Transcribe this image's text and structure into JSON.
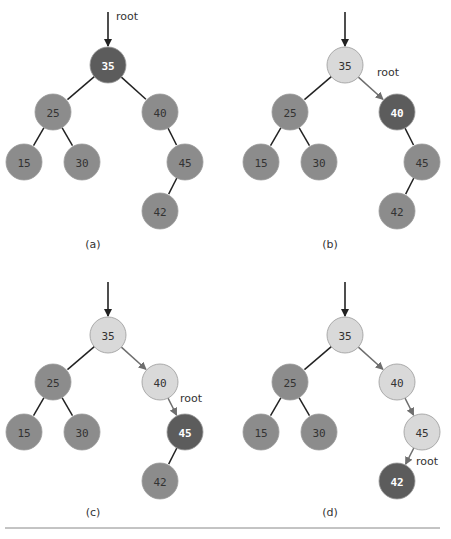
{
  "colors": {
    "current": "#5c5c5c",
    "visited": "#d9d9d9",
    "unvisited": "#8c8c8c",
    "edge": "#222222",
    "path_edge": "#6e6e6e",
    "text_dark": "#333333",
    "text_light": "#ffffff",
    "rule": "#888888"
  },
  "root_label": "root",
  "panels": [
    {
      "caption": "(a)",
      "current": "35",
      "visited": []
    },
    {
      "caption": "(b)",
      "current": "40",
      "visited": [
        "35"
      ]
    },
    {
      "caption": "(c)",
      "current": "45",
      "visited": [
        "35",
        "40"
      ]
    },
    {
      "caption": "(d)",
      "current": "42",
      "visited": [
        "35",
        "40",
        "45"
      ]
    }
  ],
  "tree": {
    "nodes": [
      "35",
      "25",
      "40",
      "15",
      "30",
      "45",
      "42"
    ],
    "edges": [
      [
        "35",
        "25"
      ],
      [
        "35",
        "40"
      ],
      [
        "25",
        "15"
      ],
      [
        "25",
        "30"
      ],
      [
        "40",
        "45"
      ],
      [
        "45",
        "42"
      ]
    ]
  }
}
